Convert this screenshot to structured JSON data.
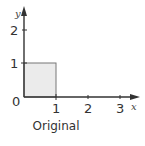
{
  "diagram": {
    "caption": "Original",
    "x_axis": {
      "name": "x",
      "origin_label": "0",
      "ticks": [
        {
          "label": "1",
          "value": 1
        },
        {
          "label": "2",
          "value": 2
        },
        {
          "label": "3",
          "value": 3
        }
      ]
    },
    "y_axis": {
      "name": "y",
      "ticks": [
        {
          "label": "1",
          "value": 1
        },
        {
          "label": "2",
          "value": 2
        }
      ]
    },
    "shape": {
      "type": "unit-square",
      "corners": [
        [
          0,
          0
        ],
        [
          1,
          0
        ],
        [
          1,
          1
        ],
        [
          0,
          1
        ]
      ],
      "fill": "#ebebeb",
      "stroke": "#666666"
    },
    "colors": {
      "axis": "#333333"
    }
  }
}
